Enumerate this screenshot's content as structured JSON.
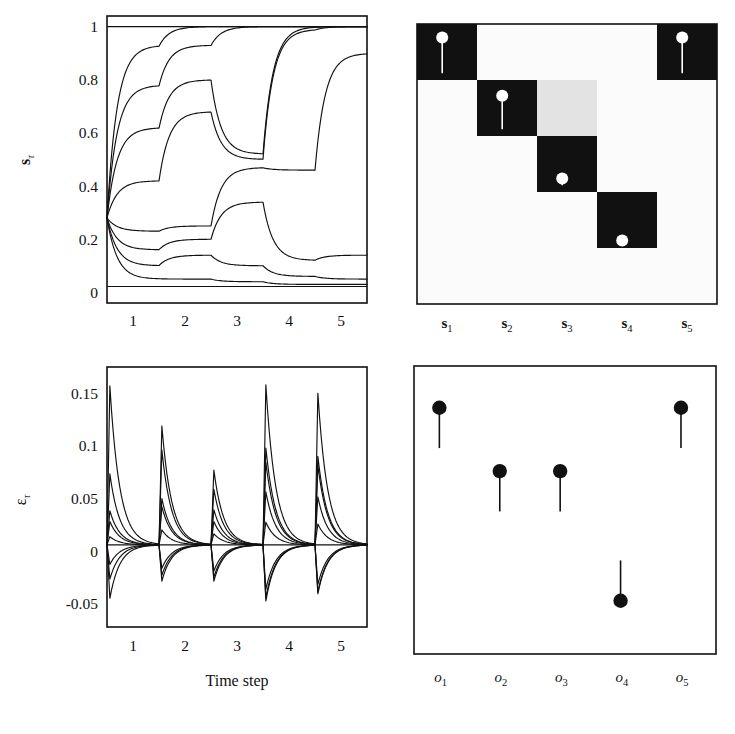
{
  "figure": {
    "panels": [
      "state-trajectories",
      "state-matrix",
      "error-trajectories",
      "output-stems"
    ]
  },
  "chart_data": [
    {
      "id": "state-trajectories",
      "type": "line",
      "title": "",
      "xlabel": "",
      "ylabel": "sτ",
      "ylabel_base": "s",
      "ylabel_sub": "τ",
      "xlim": [
        0.5,
        5.5
      ],
      "ylim": [
        -0.04,
        1.04
      ],
      "xticks": [
        1,
        2,
        3,
        4,
        5
      ],
      "xticklabels": [
        "1",
        "2",
        "3",
        "4",
        "5"
      ],
      "yticks": [
        0,
        0.2,
        0.4,
        0.6,
        0.8,
        1
      ],
      "yticklabels": [
        "0",
        "0.2",
        "0.4",
        "0.6",
        "0.8",
        "1"
      ],
      "grid": false,
      "legend": null,
      "note": "Eight sigmoidal state units relaxing between saturation bounds 0 and 1 over five time steps; all units start near 0.28.",
      "start_value": 0.28,
      "asymptote_high": 1.0,
      "asymptote_low": 0.0,
      "series": [
        {
          "name": "s unit 1",
          "targets": [
            0.93,
            1.0,
            1.0,
            1.0,
            1.0
          ]
        },
        {
          "name": "s unit 2",
          "targets": [
            0.78,
            0.93,
            1.0,
            1.0,
            1.0
          ]
        },
        {
          "name": "s unit 3",
          "targets": [
            0.62,
            0.8,
            0.52,
            1.0,
            1.0
          ]
        },
        {
          "name": "s unit 4",
          "targets": [
            0.42,
            0.68,
            0.5,
            0.99,
            1.0
          ]
        },
        {
          "name": "s unit 5",
          "targets": [
            0.23,
            0.25,
            0.47,
            0.46,
            0.9
          ]
        },
        {
          "name": "s unit 6",
          "targets": [
            0.16,
            0.2,
            0.34,
            0.12,
            0.14
          ]
        },
        {
          "name": "s unit 7",
          "targets": [
            0.1,
            0.14,
            0.1,
            0.06,
            0.05
          ]
        },
        {
          "name": "s unit 8",
          "targets": [
            0.05,
            0.05,
            0.04,
            0.03,
            0.03
          ]
        }
      ]
    },
    {
      "id": "state-matrix",
      "type": "heatmap",
      "title": "",
      "xlabel": "",
      "ylabel": "",
      "columns": [
        "s1",
        "s2",
        "s3",
        "s4",
        "s5"
      ],
      "column_labels": [
        {
          "base": "s",
          "sub": "1"
        },
        {
          "base": "s",
          "sub": "2"
        },
        {
          "base": "s",
          "sub": "3"
        },
        {
          "base": "s",
          "sub": "4"
        },
        {
          "base": "s",
          "sub": "5"
        }
      ],
      "rows": 5,
      "cols": 5,
      "colors": {
        "on": "#111111",
        "mid": "#e3e3e3",
        "off": "#fbfbfb"
      },
      "values": [
        [
          1,
          0,
          0,
          0,
          1
        ],
        [
          0,
          1,
          0.5,
          0,
          0
        ],
        [
          0,
          0,
          1,
          0,
          0
        ],
        [
          0,
          0,
          0,
          1,
          0
        ],
        [
          0,
          0,
          0,
          0,
          0
        ]
      ],
      "stems": [
        {
          "row": 0,
          "col": 0,
          "value": 0.78,
          "polarity": "light"
        },
        {
          "row": 0,
          "col": 4,
          "value": 0.78,
          "polarity": "light"
        },
        {
          "row": 1,
          "col": 1,
          "value": 0.74,
          "polarity": "light"
        },
        {
          "row": 2,
          "col": 2,
          "value": 0.22,
          "polarity": "light"
        },
        {
          "row": 3,
          "col": 3,
          "value": 0.1,
          "polarity": "light"
        }
      ]
    },
    {
      "id": "error-trajectories",
      "type": "line",
      "title": "",
      "xlabel": "Time step",
      "ylabel": "ετ",
      "ylabel_base": "ε",
      "ylabel_sub": "τ",
      "xlim": [
        0.5,
        5.5
      ],
      "ylim": [
        -0.072,
        0.175
      ],
      "xticks": [
        1,
        2,
        3,
        4,
        5
      ],
      "xticklabels": [
        "1",
        "2",
        "3",
        "4",
        "5"
      ],
      "yticks": [
        -0.05,
        0,
        0.05,
        0.1,
        0.15
      ],
      "yticklabels": [
        "-0.05",
        "0",
        "0.05",
        "0.1",
        "0.15"
      ],
      "grid": false,
      "legend": null,
      "note": "Error signals spike at each time step boundary then decay toward zero; peak magnitudes per step.",
      "peaks_positive": [
        0.157,
        0.119,
        0.077,
        0.158,
        0.15
      ],
      "peaks_negative": [
        -0.052,
        -0.033,
        -0.033,
        -0.055,
        -0.047
      ],
      "series": [
        {
          "name": "error unit 1",
          "peaks": [
            0.157,
            0.119,
            0.077,
            0.158,
            0.15
          ]
        },
        {
          "name": "error unit 2",
          "peaks": [
            0.075,
            0.098,
            0.06,
            0.1,
            0.092
          ]
        },
        {
          "name": "error unit 3",
          "peaks": [
            0.04,
            0.052,
            0.041,
            0.088,
            0.085
          ]
        },
        {
          "name": "error unit 4",
          "peaks": [
            0.03,
            0.045,
            0.03,
            0.06,
            0.055
          ]
        },
        {
          "name": "error unit 5",
          "peaks": [
            0.015,
            0.022,
            0.018,
            0.03,
            0.028
          ]
        },
        {
          "name": "error unit 6",
          "peaks": [
            -0.014,
            -0.018,
            -0.021,
            -0.04,
            -0.035
          ]
        },
        {
          "name": "error unit 7",
          "peaks": [
            -0.03,
            -0.026,
            -0.028,
            -0.05,
            -0.044
          ]
        },
        {
          "name": "error unit 8",
          "peaks": [
            -0.052,
            -0.033,
            -0.033,
            -0.055,
            -0.047
          ]
        }
      ]
    },
    {
      "id": "output-stems",
      "type": "scatter",
      "subtype": "stem",
      "title": "",
      "xlabel": "",
      "ylabel": "",
      "categories": [
        "o1",
        "o2",
        "o3",
        "o4",
        "o5"
      ],
      "category_labels": [
        {
          "base": "o",
          "sub": "1"
        },
        {
          "base": "o",
          "sub": "2"
        },
        {
          "base": "o",
          "sub": "3"
        },
        {
          "base": "o",
          "sub": "4"
        },
        {
          "base": "o",
          "sub": "5"
        }
      ],
      "ylim": [
        0,
        1
      ],
      "values": [
        0.855,
        0.635,
        0.635,
        0.185,
        0.855
      ],
      "stem_bases": [
        0.715,
        0.495,
        0.495,
        0.325,
        0.715
      ],
      "marker": "filled-circle",
      "color": "#111111"
    }
  ]
}
